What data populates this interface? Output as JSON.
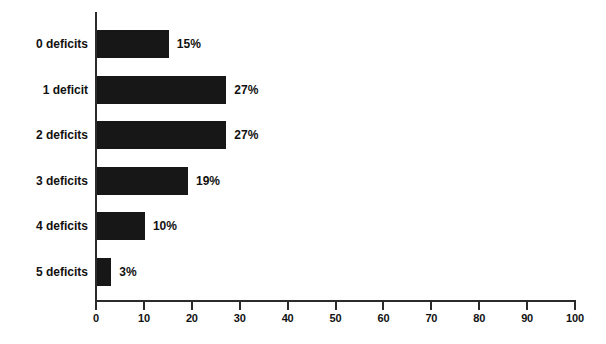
{
  "chart_data": {
    "type": "bar",
    "orientation": "horizontal",
    "title": "",
    "subtitle": "",
    "xlabel": "",
    "ylabel": "",
    "categories": [
      "0 deficits",
      "1 deficit",
      "2 deficits",
      "3 deficits",
      "4 deficits",
      "5 deficits"
    ],
    "values": [
      15,
      27,
      27,
      19,
      10,
      3
    ],
    "value_labels": [
      "15%",
      "27%",
      "27%",
      "19%",
      "10%",
      "3%"
    ],
    "xlim": [
      0,
      100
    ],
    "xticks": [
      0,
      10,
      20,
      30,
      40,
      50,
      60,
      70,
      80,
      90,
      100
    ],
    "xtick_labels": [
      "0",
      "10",
      "20",
      "30",
      "40",
      "50",
      "60",
      "70",
      "80",
      "90",
      "100"
    ],
    "grid": false,
    "legend": null,
    "series": [
      {
        "name": "Percent of sample",
        "values": [
          15,
          27,
          27,
          19,
          10,
          3
        ]
      }
    ]
  },
  "style": {
    "bar_color": "#171717",
    "axis_color": "#2b2b2b",
    "text_color": "#111111",
    "background": "#ffffff"
  }
}
